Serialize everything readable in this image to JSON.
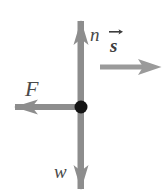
{
  "figure": {
    "type": "free-body-diagram",
    "title": "",
    "background_color": "#ffffff",
    "width": 164,
    "height": 194
  },
  "colors": {
    "arrow_gray": "#8d8d8d",
    "arrow_gray_dark": "#7a7a7a",
    "particle_black": "#141414",
    "label_gray": "#4a4a4a",
    "vector_label_gray": "#3d3d3d"
  },
  "particle": {
    "name": "particle",
    "x": 81,
    "y": 107,
    "radius": 6.5,
    "color": "#141414"
  },
  "vectors": [
    {
      "id": "normal-force",
      "label": "n",
      "symbol": "n",
      "direction": "up",
      "has_vector_hat": false,
      "tail": [
        81,
        107
      ],
      "tip": [
        81,
        21
      ],
      "label_x": 90,
      "label_y": 25,
      "description": "normal force pointing up"
    },
    {
      "id": "applied-force",
      "label": "F",
      "symbol": "F",
      "direction": "left",
      "has_vector_hat": false,
      "tail": [
        81,
        107
      ],
      "tip": [
        15,
        107
      ],
      "label_x": 25,
      "label_y": 78,
      "description": "force F pointing left"
    },
    {
      "id": "weight-force",
      "label": "w",
      "symbol": "w",
      "direction": "down",
      "has_vector_hat": false,
      "tail": [
        81,
        107
      ],
      "tip": [
        81,
        189
      ],
      "label_x": 54,
      "label_y": 162,
      "description": "weight pointing down"
    },
    {
      "id": "displacement-vector",
      "label": "s",
      "symbol": "s",
      "has_vector_hat": true,
      "direction": "right",
      "tail": [
        100,
        67
      ],
      "tip": [
        161,
        67
      ],
      "label_x": 108,
      "label_y": 27,
      "description": "displacement vector s pointing right, drawn separately from the force diagram"
    }
  ],
  "labels": {
    "n": "n",
    "F": "F",
    "w": "w",
    "s": "s"
  }
}
